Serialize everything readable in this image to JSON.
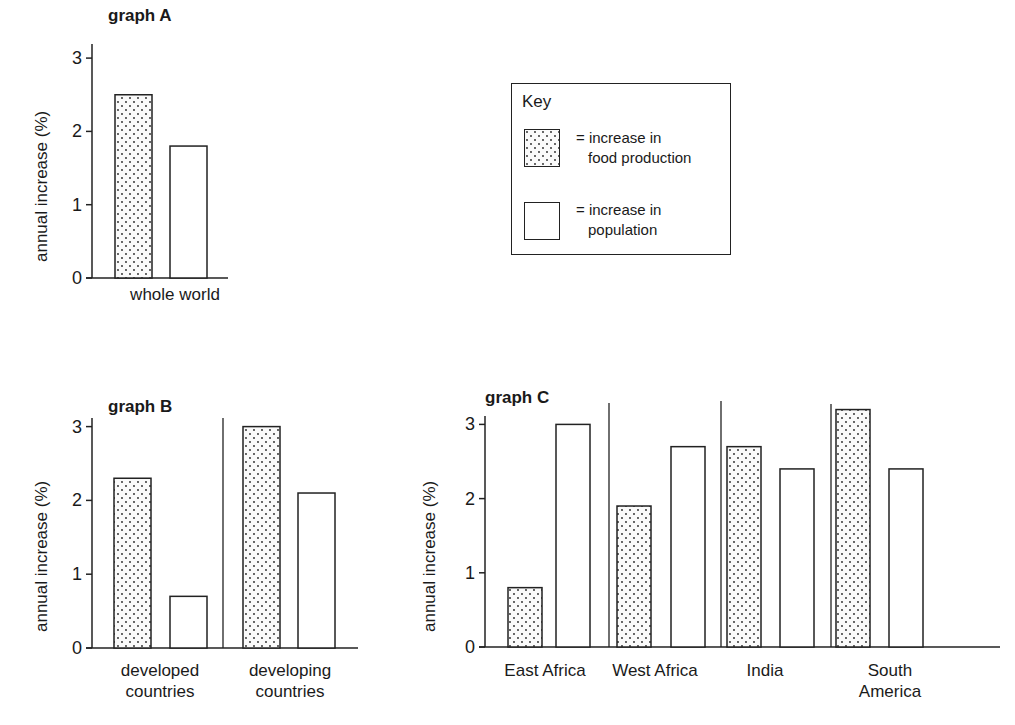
{
  "figure": {
    "key": {
      "title": "Key",
      "items": [
        {
          "pattern": "dotted",
          "line1": "= increase in",
          "line2": "food production"
        },
        {
          "pattern": "plain",
          "line1": "= increase in",
          "line2": "population"
        }
      ]
    },
    "footer_text_partial": "...food production and population growth (1970s-80s)"
  },
  "chart_data": [
    {
      "type": "bar",
      "title": "graph A",
      "ylabel": "annual increase (%)",
      "xlabel": "",
      "ylim": [
        0,
        3
      ],
      "yticks": [
        "0",
        "1",
        "2",
        "3"
      ],
      "categories": [
        "whole world"
      ],
      "series": [
        {
          "name": "increase in food production",
          "pattern": "dotted",
          "values": [
            2.5
          ]
        },
        {
          "name": "increase in population",
          "pattern": "plain",
          "values": [
            1.8
          ]
        }
      ],
      "grid": false,
      "legend_position": "shared key box, upper right"
    },
    {
      "type": "bar",
      "title": "graph B",
      "ylabel": "annual increase (%)",
      "xlabel": "",
      "ylim": [
        0,
        3
      ],
      "yticks": [
        "0",
        "1",
        "2",
        "3"
      ],
      "categories": [
        "developed countries",
        "developing countries"
      ],
      "category_lines": [
        [
          "developed",
          "countries"
        ],
        [
          "developing",
          "countries"
        ]
      ],
      "series": [
        {
          "name": "increase in food production",
          "pattern": "dotted",
          "values": [
            2.3,
            3.0
          ]
        },
        {
          "name": "increase in population",
          "pattern": "plain",
          "values": [
            0.7,
            2.1
          ]
        }
      ],
      "grid": false
    },
    {
      "type": "bar",
      "title": "graph C",
      "ylabel": "annual increase (%)",
      "xlabel": "",
      "ylim": [
        0,
        3.2
      ],
      "yticks": [
        "0",
        "1",
        "2",
        "3"
      ],
      "categories": [
        "East Africa",
        "West Africa",
        "India",
        "South America"
      ],
      "category_lines": [
        [
          "East Africa"
        ],
        [
          "West Africa"
        ],
        [
          "India"
        ],
        [
          "South",
          "America"
        ]
      ],
      "series": [
        {
          "name": "increase in food production",
          "pattern": "dotted",
          "values": [
            0.8,
            1.9,
            2.7,
            3.2
          ]
        },
        {
          "name": "increase in population",
          "pattern": "plain",
          "values": [
            3.0,
            2.7,
            2.4,
            2.4
          ]
        }
      ],
      "grid": false
    }
  ]
}
